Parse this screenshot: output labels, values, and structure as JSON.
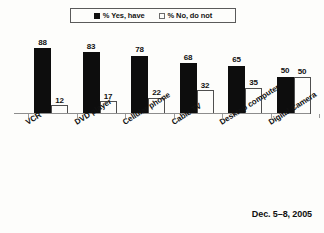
{
  "chart_data": {
    "type": "bar",
    "title": "",
    "subtitle": "",
    "xlabel": "",
    "ylabel": "",
    "ylim": [
      0,
      100
    ],
    "grid": false,
    "legend_position": "top-center",
    "categories": [
      "VCR",
      "DVD player",
      "Cellular phone",
      "Cable TV",
      "Desktop computer",
      "Digital Camera"
    ],
    "series": [
      {
        "name": "% Yes, have",
        "color": "#0d0d0d",
        "style": "filled",
        "values": [
          88,
          83,
          78,
          68,
          65,
          50
        ]
      },
      {
        "name": "% No, do not",
        "color": "#fdfdfb",
        "style": "hollow",
        "values": [
          12,
          17,
          22,
          32,
          35,
          50
        ]
      }
    ],
    "annotations": [
      "Dec. 5–8, 2005"
    ]
  },
  "legend": {
    "entries": [
      {
        "label": "% Yes, have",
        "swatch": "filled-square-icon"
      },
      {
        "label": "% No, do not",
        "swatch": "hollow-square-icon"
      }
    ]
  },
  "footer": {
    "date_label": "Dec. 5–8, 2005"
  },
  "axis": {
    "baseline_visible": true,
    "tick_count": 7
  }
}
